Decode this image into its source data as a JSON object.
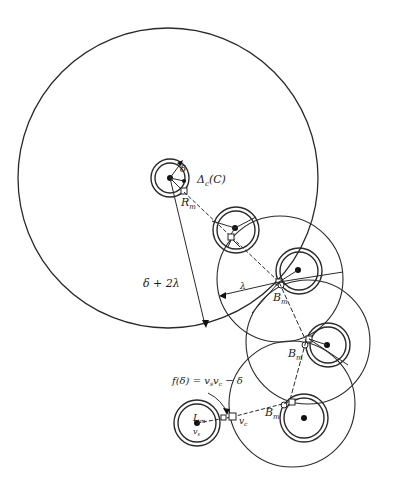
{
  "diagram": {
    "colors": {
      "ink": "#2a2a2a",
      "background": "#ffffff"
    },
    "labels": {
      "delta": "δ",
      "delta_c": "Δ",
      "delta_c_sub": "c",
      "delta_c_arg": "(C)",
      "r_m": "R",
      "r_m_sub": "m",
      "radius_big": "δ + 2λ",
      "lambda": "λ",
      "b_m_1": "B",
      "b_m_2": "B",
      "b_m_3": "B",
      "b_m_sub": "m",
      "f_delta": "f(δ) = v",
      "f_delta_sub1": "s",
      "f_delta_mid": "v",
      "f_delta_sub2": "c",
      "f_delta_tail": " − δ",
      "l_m": "L",
      "l_m_sub": "m",
      "v_s": "v",
      "v_s_sub": "s",
      "v_c": "v",
      "v_c_sub": "c"
    }
  }
}
